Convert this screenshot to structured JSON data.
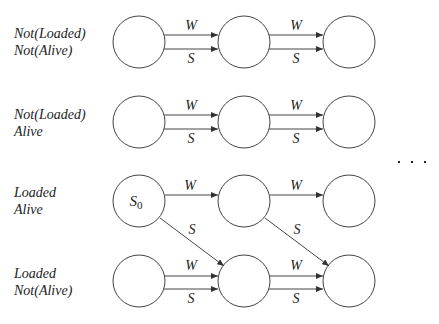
{
  "rows": [
    {
      "label_line1": "Not(Loaded)",
      "label_line2": "Not(Alive)",
      "y": 42,
      "arrows": [
        "W",
        "S"
      ]
    },
    {
      "label_line1": "Not(Loaded)",
      "label_line2": "Alive",
      "y": 122,
      "arrows": [
        "W",
        "S"
      ]
    },
    {
      "label_line1": "Loaded",
      "label_line2": "Alive",
      "y": 201,
      "arrows": [
        "W"
      ]
    },
    {
      "label_line1": "Loaded",
      "label_line2": "Not(Alive)",
      "y": 281,
      "arrows": [
        "W",
        "S"
      ]
    }
  ],
  "start_state_label": "S",
  "start_state_sub": "0",
  "edge_labels": {
    "wait": "W",
    "shoot": "S"
  },
  "ellipsis": "· · ·",
  "colors": {
    "stroke": "#444444",
    "text": "#222222"
  }
}
